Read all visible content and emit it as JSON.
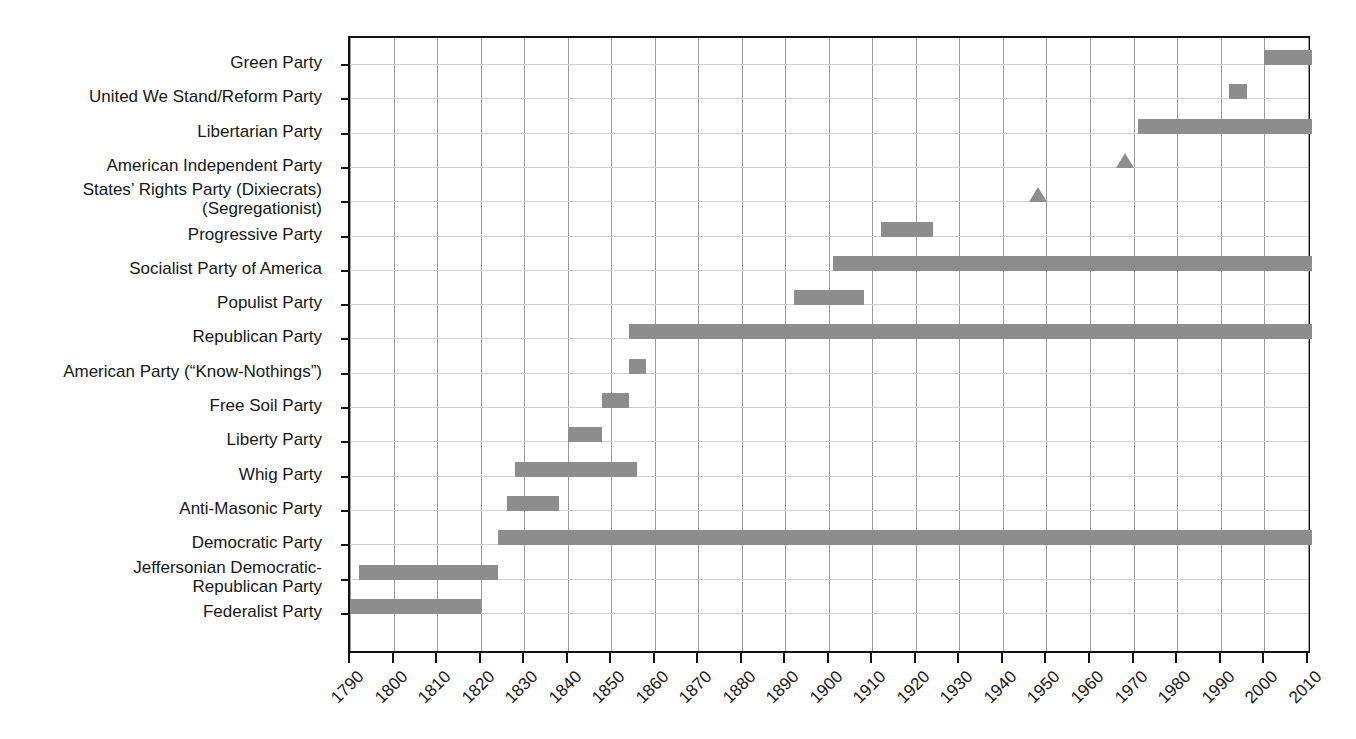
{
  "chart_data": {
    "type": "bar",
    "orientation": "horizontal",
    "subtype": "timeline-gantt",
    "title": "",
    "subtitle": "",
    "xlabel": "",
    "ylabel": "",
    "xlim": [
      1790,
      2011
    ],
    "grid": "vertical-and-horizontal",
    "legend": "none",
    "bar_color": "#8d8d8d",
    "axis_color": "#111111",
    "gridline_color": "#9a9a9a",
    "background": "#ffffff",
    "x_ticks": [
      1790,
      1800,
      1810,
      1820,
      1830,
      1840,
      1850,
      1860,
      1870,
      1880,
      1890,
      1900,
      1910,
      1920,
      1930,
      1940,
      1950,
      1960,
      1970,
      1980,
      1990,
      2000,
      2010
    ],
    "x_tick_labels": [
      "1790",
      "1800",
      "1810",
      "1820",
      "1830",
      "1840",
      "1850",
      "1860",
      "1870",
      "1880",
      "1890",
      "1900",
      "1910",
      "1920",
      "1930",
      "1940",
      "1950",
      "1960",
      "1970",
      "1980",
      "1990",
      "2000",
      "2010"
    ],
    "categories": [
      "Green Party",
      "United We Stand/Reform Party",
      "Libertarian Party",
      "American Independent Party",
      "States' Rights Party (Dixiecrats) (Segregationist)",
      "Progressive Party",
      "Socialist Party of America",
      "Populist Party",
      "Republican Party",
      "American Party (“Know-Nothings”)",
      "Free Soil Party",
      "Liberty Party",
      "Whig Party",
      "Anti-Masonic Party",
      "Democratic Party",
      "Jeffersonian Democratic-Republican Party",
      "Federalist Party"
    ],
    "series": [
      {
        "name": "Party active period",
        "values": [
          {
            "category": "Green Party",
            "start": 2000,
            "end": 2011,
            "marker": "bar"
          },
          {
            "category": "United We Stand/Reform Party",
            "start": 1992,
            "end": 1996,
            "marker": "square"
          },
          {
            "category": "Libertarian Party",
            "start": 1971,
            "end": 2011,
            "marker": "bar"
          },
          {
            "category": "American Independent Party",
            "start": 1968,
            "end": 1968,
            "marker": "triangle"
          },
          {
            "category": "States' Rights Party (Dixiecrats) (Segregationist)",
            "start": 1948,
            "end": 1948,
            "marker": "triangle"
          },
          {
            "category": "Progressive Party",
            "start": 1912,
            "end": 1924,
            "marker": "bar"
          },
          {
            "category": "Socialist Party of America",
            "start": 1901,
            "end": 2011,
            "marker": "bar"
          },
          {
            "category": "Populist Party",
            "start": 1892,
            "end": 1908,
            "marker": "bar"
          },
          {
            "category": "Republican Party",
            "start": 1854,
            "end": 2011,
            "marker": "bar"
          },
          {
            "category": "American Party (“Know-Nothings”)",
            "start": 1854,
            "end": 1858,
            "marker": "bar"
          },
          {
            "category": "Free Soil Party",
            "start": 1848,
            "end": 1854,
            "marker": "bar"
          },
          {
            "category": "Liberty Party",
            "start": 1840,
            "end": 1848,
            "marker": "bar"
          },
          {
            "category": "Whig Party",
            "start": 1828,
            "end": 1856,
            "marker": "bar"
          },
          {
            "category": "Anti-Masonic Party",
            "start": 1826,
            "end": 1838,
            "marker": "bar"
          },
          {
            "category": "Democratic Party",
            "start": 1824,
            "end": 2011,
            "marker": "bar"
          },
          {
            "category": "Jeffersonian Democratic-Republican Party",
            "start": 1792,
            "end": 1824,
            "marker": "bar"
          },
          {
            "category": "Federalist Party",
            "start": 1790,
            "end": 1820,
            "marker": "bar"
          }
        ]
      }
    ]
  },
  "y_axis": {
    "labels": [
      {
        "id": "green-party",
        "text": "Green Party",
        "line1": "Green Party",
        "line2": ""
      },
      {
        "id": "united-we-stand-reform-party",
        "text": "United We Stand/Reform Party",
        "line1": "United We Stand/Reform Party",
        "line2": ""
      },
      {
        "id": "libertarian-party",
        "text": "Libertarian Party",
        "line1": "Libertarian Party",
        "line2": ""
      },
      {
        "id": "american-independent-party",
        "text": "American Independent Party",
        "line1": "American Independent Party",
        "line2": ""
      },
      {
        "id": "states-rights-party",
        "text": "States’ Rights Party (Dixiecrats) (Segregationist)",
        "line1": "States’ Rights Party (Dixiecrats)",
        "line2": "(Segregationist)"
      },
      {
        "id": "progressive-party",
        "text": "Progressive Party",
        "line1": "Progressive Party",
        "line2": ""
      },
      {
        "id": "socialist-party-of-america",
        "text": "Socialist Party of America",
        "line1": "Socialist Party of America",
        "line2": ""
      },
      {
        "id": "populist-party",
        "text": "Populist Party",
        "line1": "Populist Party",
        "line2": ""
      },
      {
        "id": "republican-party",
        "text": "Republican Party",
        "line1": "Republican Party",
        "line2": ""
      },
      {
        "id": "american-party-know-nothings",
        "text": "American Party (“Know-Nothings”)",
        "line1": "American Party (“Know-Nothings”)",
        "line2": ""
      },
      {
        "id": "free-soil-party",
        "text": "Free Soil Party",
        "line1": "Free Soil Party",
        "line2": ""
      },
      {
        "id": "liberty-party",
        "text": "Liberty Party",
        "line1": "Liberty Party",
        "line2": ""
      },
      {
        "id": "whig-party",
        "text": "Whig Party",
        "line1": "Whig Party",
        "line2": ""
      },
      {
        "id": "anti-masonic-party",
        "text": "Anti-Masonic Party",
        "line1": "Anti-Masonic Party",
        "line2": ""
      },
      {
        "id": "democratic-party",
        "text": "Democratic Party",
        "line1": "Democratic Party",
        "line2": ""
      },
      {
        "id": "jeffersonian-democratic-republican-party",
        "text": "Jeffersonian Democratic-Republican Party",
        "line1": "Jeffersonian Democratic-",
        "line2": "Republican Party"
      },
      {
        "id": "federalist-party",
        "text": "Federalist Party",
        "line1": "Federalist Party",
        "line2": ""
      }
    ]
  }
}
